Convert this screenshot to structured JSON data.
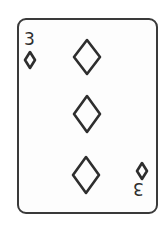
{
  "card": {
    "rank": "3",
    "suit": "diamonds",
    "suit_icon": "diamond-outline-icon",
    "style": "outline line-art",
    "colors": {
      "stroke": "#2e2e2e",
      "background": "#fdfdfd",
      "border": "#3a3a3a"
    },
    "corner_index": {
      "top_left": {
        "rank": "3",
        "suit": "diamonds"
      },
      "bottom_right": {
        "rank": "3",
        "suit": "diamonds",
        "rotated": true
      }
    },
    "pips": [
      {
        "position": "top",
        "cx": 87,
        "cy": 57
      },
      {
        "position": "middle",
        "cx": 87,
        "cy": 114
      },
      {
        "position": "bottom",
        "cx": 86,
        "cy": 175
      }
    ]
  }
}
